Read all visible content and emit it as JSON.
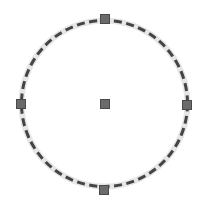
{
  "shape": {
    "type": "circle",
    "center": {
      "x": 104.5,
      "y": 103.5
    },
    "radius": 83,
    "stroke_color": "#444444",
    "halo_color": "#e6e6e6",
    "stroke_width": 3,
    "dash_array": "8 4.5",
    "fill": "none"
  },
  "handles": [
    {
      "name": "handle-top",
      "x": 105,
      "y": 19
    },
    {
      "name": "handle-left",
      "x": 21,
      "y": 104
    },
    {
      "name": "handle-right",
      "x": 187,
      "y": 105
    },
    {
      "name": "handle-bottom",
      "x": 104,
      "y": 190
    },
    {
      "name": "handle-center",
      "x": 105,
      "y": 104
    }
  ],
  "handle_style": {
    "size": 10,
    "fill": "#6b6b6b",
    "border": "#4a4a4a"
  }
}
